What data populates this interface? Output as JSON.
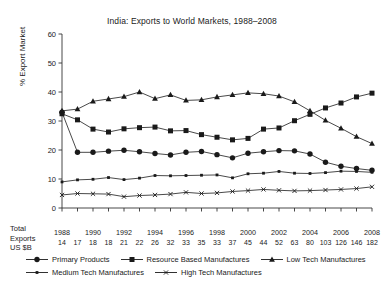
{
  "chart_data": {
    "type": "line",
    "title": "India: Exports to World Markets, 1988–2008",
    "xlabel": "",
    "ylabel": "% Export Market",
    "ylim": [
      0,
      60
    ],
    "ytick_step": 10,
    "yticks": [
      "0",
      "10",
      "20",
      "30",
      "40",
      "50",
      "60"
    ],
    "grid": false,
    "legend_position": "bottom",
    "x": [
      1988,
      1989,
      1990,
      1991,
      1992,
      1993,
      1994,
      1995,
      1996,
      1997,
      1998,
      1999,
      2000,
      2001,
      2002,
      2003,
      2004,
      2005,
      2006,
      2007,
      2008
    ],
    "xtick_labels": [
      "1988",
      "1990",
      "1992",
      "1994",
      "1996",
      "1998",
      "2000",
      "2002",
      "2004",
      "2006",
      "2008"
    ],
    "secondary_axis_label": "Total Exports US $B",
    "secondary_axis_values": [
      14,
      17,
      18,
      18,
      21,
      22,
      26,
      32,
      33,
      35,
      33,
      37,
      45,
      44,
      52,
      63,
      80,
      103,
      126,
      146,
      182
    ],
    "series": [
      {
        "name": "Primary Products",
        "marker": "circle",
        "values": [
          33.0,
          19.2,
          19.2,
          19.6,
          19.9,
          19.4,
          18.8,
          18.3,
          19.2,
          19.5,
          18.4,
          17.3,
          18.9,
          19.4,
          19.8,
          19.7,
          18.6,
          15.8,
          14.4,
          13.6,
          13.0
        ]
      },
      {
        "name": "Resource Based Manufactures",
        "marker": "square",
        "values": [
          32.5,
          30.4,
          27.2,
          26.2,
          27.3,
          27.7,
          27.9,
          26.6,
          26.7,
          25.3,
          24.4,
          23.5,
          24.0,
          27.2,
          27.6,
          30.1,
          32.3,
          34.5,
          36.2,
          38.3,
          39.6
        ]
      },
      {
        "name": "Low Tech Manufactures",
        "marker": "triangle",
        "values": [
          33.5,
          34.1,
          36.8,
          37.6,
          38.4,
          40.0,
          37.7,
          39.0,
          37.1,
          37.3,
          38.3,
          39.0,
          39.7,
          39.4,
          38.6,
          36.6,
          33.5,
          30.2,
          27.5,
          24.6,
          22.2
        ]
      },
      {
        "name": "Medium Tech Manufactures",
        "marker": "small-square",
        "values": [
          9.0,
          9.7,
          9.9,
          10.5,
          9.8,
          10.3,
          11.2,
          11.1,
          11.2,
          11.3,
          11.4,
          10.4,
          11.8,
          12.0,
          12.6,
          12.0,
          11.9,
          12.2,
          12.7,
          12.6,
          12.3
        ]
      },
      {
        "name": "High Tech Manufactures",
        "marker": "cross",
        "values": [
          4.5,
          5.0,
          4.9,
          4.8,
          3.9,
          4.3,
          4.5,
          4.8,
          5.4,
          5.0,
          5.2,
          5.7,
          6.0,
          6.4,
          6.1,
          5.9,
          6.0,
          6.2,
          6.4,
          6.7,
          7.3
        ]
      }
    ]
  },
  "colors": {
    "ink": "#1a1a1a",
    "axis": "#333333",
    "background": "#ffffff"
  }
}
